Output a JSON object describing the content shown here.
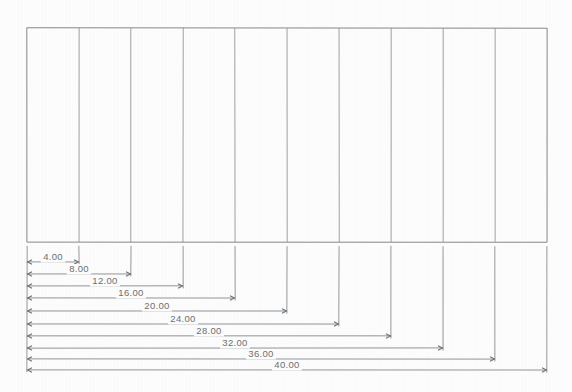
{
  "drawing": {
    "title": "Cumulative linear dimension drawing",
    "paper_color": "#fefefe",
    "line_color": "#8c8f92",
    "text_color": "#6d7073",
    "part": {
      "name": "divided-rectangle",
      "left": 27,
      "right": 547,
      "top": 28,
      "bottom": 242,
      "column_count": 10,
      "divider_x": [
        79,
        131,
        183,
        235,
        287,
        339,
        391,
        443,
        495
      ],
      "boundary_x": [
        27,
        79,
        131,
        183,
        235,
        287,
        339,
        391,
        443,
        495,
        547
      ]
    },
    "dimensions": [
      {
        "label": "4.00",
        "value": 4,
        "start_x": 27,
        "end_x": 79,
        "line_y": 262,
        "text_x": 53,
        "text_y": 260
      },
      {
        "label": "8.00",
        "value": 8,
        "start_x": 27,
        "end_x": 131,
        "line_y": 274,
        "text_x": 79,
        "text_y": 272
      },
      {
        "label": "12.00",
        "value": 12,
        "start_x": 27,
        "end_x": 183,
        "line_y": 286,
        "text_x": 105,
        "text_y": 284
      },
      {
        "label": "16.00",
        "value": 16,
        "start_x": 27,
        "end_x": 235,
        "line_y": 298,
        "text_x": 131,
        "text_y": 296
      },
      {
        "label": "20.00",
        "value": 20,
        "start_x": 27,
        "end_x": 287,
        "line_y": 311,
        "text_x": 157,
        "text_y": 309
      },
      {
        "label": "24.00",
        "value": 24,
        "start_x": 27,
        "end_x": 339,
        "line_y": 324,
        "text_x": 183,
        "text_y": 322
      },
      {
        "label": "28.00",
        "value": 28,
        "start_x": 27,
        "end_x": 391,
        "line_y": 336,
        "text_x": 209,
        "text_y": 334
      },
      {
        "label": "32.00",
        "value": 32,
        "start_x": 27,
        "end_x": 443,
        "line_y": 348,
        "text_x": 235,
        "text_y": 346
      },
      {
        "label": "36.00",
        "value": 36,
        "start_x": 27,
        "end_x": 495,
        "line_y": 359,
        "text_x": 261,
        "text_y": 357
      },
      {
        "label": "40.00",
        "value": 40,
        "start_x": 27,
        "end_x": 547,
        "line_y": 370,
        "text_x": 287,
        "text_y": 368
      }
    ],
    "units": "",
    "dimension_style": "baseline-cumulative",
    "extension_line_top_y": 246
  }
}
